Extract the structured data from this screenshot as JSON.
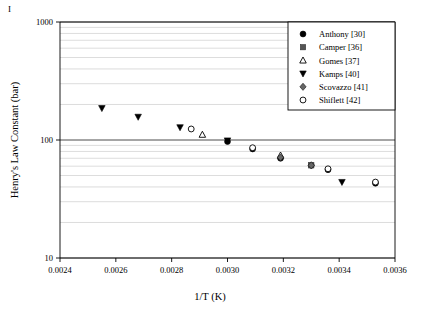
{
  "figure": {
    "corner_mark": "I",
    "background_color": "#ffffff",
    "foreground_color": "#000000"
  },
  "chart_data": {
    "type": "scatter",
    "title": "",
    "xlabel": "1/T (K)",
    "ylabel": "Henry's Law Constant (bar)",
    "xlim": [
      0.0024,
      0.0036
    ],
    "ylim": [
      10,
      1000
    ],
    "yscale": "log",
    "xscale": "linear",
    "grid": "horizontal-log-minor",
    "legend_position": "top-right",
    "xticks": [
      0.0024,
      0.0026,
      0.0028,
      0.003,
      0.0032,
      0.0034,
      0.0036
    ],
    "xtick_labels": [
      "0.0024",
      "0.0026",
      "0.0028",
      "0.0030",
      "0.0032",
      "0.0034",
      "0.0036"
    ],
    "yticks": [
      10,
      100,
      1000
    ],
    "ytick_labels": [
      "10",
      "100",
      "1000"
    ],
    "series": [
      {
        "name": "Anthony [30]",
        "marker": "filled-circle",
        "color": "#000000",
        "points": [
          {
            "x": 0.003,
            "y": 97
          },
          {
            "x": 0.00309,
            "y": 84
          },
          {
            "x": 0.00319,
            "y": 70
          },
          {
            "x": 0.0033,
            "y": 61
          },
          {
            "x": 0.00336,
            "y": 56
          },
          {
            "x": 0.00353,
            "y": 43
          }
        ]
      },
      {
        "name": "Camper [36]",
        "marker": "filled-square",
        "color": "#555555",
        "points": [
          {
            "x": 0.0033,
            "y": 61
          }
        ]
      },
      {
        "name": "Gomes [37]",
        "marker": "open-triangle-up",
        "color": "#000000",
        "points": [
          {
            "x": 0.00291,
            "y": 111
          },
          {
            "x": 0.00319,
            "y": 74
          }
        ]
      },
      {
        "name": "Kamps [40]",
        "marker": "filled-triangle-down",
        "color": "#000000",
        "points": [
          {
            "x": 0.00255,
            "y": 186
          },
          {
            "x": 0.00268,
            "y": 157
          },
          {
            "x": 0.00283,
            "y": 128
          },
          {
            "x": 0.003,
            "y": 99
          },
          {
            "x": 0.00341,
            "y": 44
          }
        ]
      },
      {
        "name": "Scovazzo [41]",
        "marker": "filled-diamond",
        "color": "#666666",
        "points": [
          {
            "x": 0.00319,
            "y": 71
          },
          {
            "x": 0.0033,
            "y": 61
          }
        ]
      },
      {
        "name": "Shiflett [42]",
        "marker": "open-circle",
        "color": "#000000",
        "points": [
          {
            "x": 0.00287,
            "y": 124
          },
          {
            "x": 0.00309,
            "y": 86
          },
          {
            "x": 0.00336,
            "y": 57
          },
          {
            "x": 0.00353,
            "y": 44
          }
        ]
      }
    ]
  },
  "legend": {
    "entries": [
      {
        "label": "Anthony [30]",
        "marker": "filled-circle"
      },
      {
        "label": "Camper [36]",
        "marker": "filled-square"
      },
      {
        "label": "Gomes [37]",
        "marker": "open-triangle-up"
      },
      {
        "label": "Kamps [40]",
        "marker": "filled-triangle-down"
      },
      {
        "label": "Scovazzo [41]",
        "marker": "filled-diamond"
      },
      {
        "label": "Shiflett [42]",
        "marker": "open-circle"
      }
    ]
  }
}
